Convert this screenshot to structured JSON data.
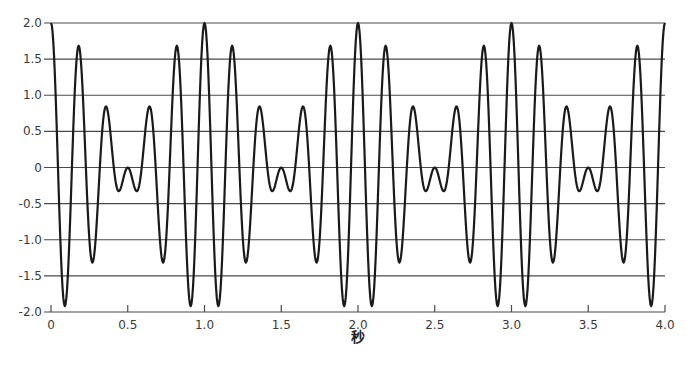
{
  "chart_data": {
    "type": "line",
    "title": "",
    "xlabel": "秒",
    "ylabel": "",
    "xlim": [
      0,
      4.0
    ],
    "ylim": [
      -2.0,
      2.0
    ],
    "grid": {
      "horizontal": true,
      "vertical": false
    },
    "legend": null,
    "x_ticks": [
      "0",
      "0.5",
      "1.0",
      "1.5",
      "2.0",
      "2.5",
      "3.0",
      "3.5",
      "4.0"
    ],
    "x_tick_values": [
      0,
      0.5,
      1.0,
      1.5,
      2.0,
      2.5,
      3.0,
      3.5,
      4.0
    ],
    "y_ticks": [
      "2.0",
      "1.5",
      "1.0",
      "0.5",
      "0",
      "-0.5",
      "-1.0",
      "-1.5",
      "-2.0"
    ],
    "y_tick_values": [
      2.0,
      1.5,
      1.0,
      0.5,
      0,
      -0.5,
      -1.0,
      -1.5,
      -2.0
    ],
    "series": [
      {
        "name": "cos(2π·5t) + cos(2π·6t)",
        "formula": "cos(10*pi*t) + cos(12*pi*t)",
        "components_hz": [
          5,
          6
        ],
        "samples_step": 0.005,
        "key_points": [
          {
            "x": 0.0,
            "y": 2.0
          },
          {
            "x": 0.09,
            "y": -1.92
          },
          {
            "x": 0.18,
            "y": 1.68
          },
          {
            "x": 0.27,
            "y": -1.3
          },
          {
            "x": 0.36,
            "y": 0.83
          },
          {
            "x": 0.45,
            "y": -0.33
          },
          {
            "x": 0.5,
            "y": 0.0
          },
          {
            "x": 0.55,
            "y": -0.33
          },
          {
            "x": 0.64,
            "y": 0.83
          },
          {
            "x": 0.73,
            "y": -1.3
          },
          {
            "x": 0.82,
            "y": 1.68
          },
          {
            "x": 0.91,
            "y": -1.92
          },
          {
            "x": 1.0,
            "y": 2.0
          }
        ],
        "period_s": 1.0
      }
    ]
  },
  "plot": {
    "left": 51,
    "right": 665,
    "top": 23,
    "bottom": 312,
    "line_color": "#1a1a1a",
    "grid_color": "#4a4a4a"
  }
}
